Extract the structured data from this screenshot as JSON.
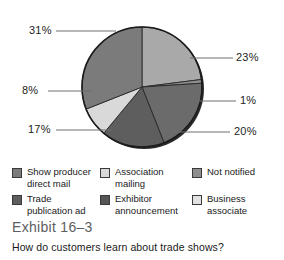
{
  "chart_data": {
    "type": "pie",
    "subtitle": "How do customers learn about trade shows?",
    "legend_position": "bottom",
    "unit": "percent",
    "categories": [
      "Show producer direct mail",
      "Association mailing",
      "Not notified",
      "Trade publication ad",
      "Exhibitor announcement",
      "Business associate"
    ],
    "values": [
      31,
      8,
      1,
      17,
      20,
      23
    ],
    "slices": [
      {
        "label": "Business associate",
        "value": 23,
        "display": "23%",
        "color": "#a9a9a9",
        "start_angle": 0,
        "end_angle": 82.8
      },
      {
        "label": "Not notified",
        "value": 1,
        "display": "1%",
        "color": "#8f8f8f",
        "start_angle": 82.8,
        "end_angle": 86.4
      },
      {
        "label": "Exhibitor announcement",
        "value": 20,
        "display": "20%",
        "color": "#6b6b6b",
        "start_angle": 86.4,
        "end_angle": 158.4
      },
      {
        "label": "Trade publication ad",
        "value": 17,
        "display": "17%",
        "color": "#5e5e5e",
        "start_angle": 158.4,
        "end_angle": 219.6
      },
      {
        "label": "Association mailing",
        "value": 8,
        "display": "8%",
        "color": "#d9d9d9",
        "start_angle": 219.6,
        "end_angle": 248.4
      },
      {
        "label": "Show producer direct mail",
        "value": 31,
        "display": "31%",
        "color": "#7b7b7b",
        "start_angle": 248.4,
        "end_angle": 360
      }
    ]
  },
  "labels": {
    "p31": "31%",
    "p23": "23%",
    "p8": "8%",
    "p1": "1%",
    "p17": "17%",
    "p20": "20%"
  },
  "legend": {
    "items": [
      {
        "label": "Show producer direct mail",
        "color": "#7b7b7b"
      },
      {
        "label": "Association mailing",
        "color": "#d9d9d9"
      },
      {
        "label": "Not notified",
        "color": "#8f8f8f"
      },
      {
        "label": "Trade publication ad",
        "color": "#5e5e5e"
      },
      {
        "label": "Exhibitor announcement",
        "color": "#555555"
      },
      {
        "label": "Business associate",
        "color": "#e2e2e2"
      }
    ]
  },
  "caption": {
    "exhibit": "Exhibit 16–3",
    "question": "How do customers learn about trade shows?"
  }
}
